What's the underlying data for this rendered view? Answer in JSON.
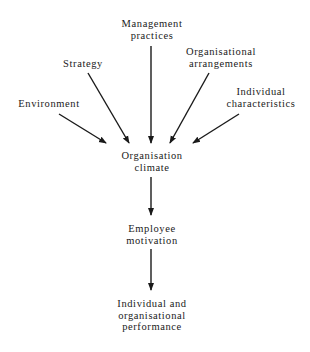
{
  "diagram": {
    "inputs": [
      {
        "id": "environment",
        "lines": [
          "Environment"
        ]
      },
      {
        "id": "strategy",
        "lines": [
          "Strategy"
        ]
      },
      {
        "id": "management-practices",
        "lines": [
          "Management",
          "practices"
        ]
      },
      {
        "id": "organisational-arrangements",
        "lines": [
          "Organisational",
          "arrangements"
        ]
      },
      {
        "id": "individual-characteristics",
        "lines": [
          "Individual",
          "characteristics"
        ]
      }
    ],
    "climate": {
      "lines": [
        "Organisation",
        "climate"
      ]
    },
    "motivation": {
      "lines": [
        "Employee",
        "motivation"
      ]
    },
    "performance": {
      "lines": [
        "Individual and",
        "organisational",
        "performance"
      ]
    },
    "edges": [
      [
        "environment",
        "climate"
      ],
      [
        "strategy",
        "climate"
      ],
      [
        "management-practices",
        "climate"
      ],
      [
        "organisational-arrangements",
        "climate"
      ],
      [
        "individual-characteristics",
        "climate"
      ],
      [
        "climate",
        "motivation"
      ],
      [
        "motivation",
        "performance"
      ]
    ]
  }
}
